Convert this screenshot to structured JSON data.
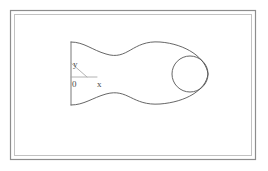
{
  "figure": {
    "title": "",
    "background_color": "#ffffff",
    "frame": {
      "outer_color": "#8d8d8d",
      "inner_color": "#c2c2c2",
      "outer": {
        "x": 10,
        "y": 10,
        "width": 246,
        "height": 150
      },
      "inner": {
        "x": 14,
        "y": 14,
        "width": 238,
        "height": 142
      }
    },
    "drawing": {
      "name": "fish-body-profile",
      "stroke_color": "#555555",
      "origin": {
        "x": 71,
        "y": 77
      },
      "tail_edge": {
        "x": 71,
        "y_top": 42,
        "y_bottom": 105
      },
      "body_path": "M71,42 C84,42 92,50 106,54 C128,61 132,40 160,42 C186,44 206,58 208,74 C206,90 186,102 160,104 C132,106 128,88 106,94 C92,98 84,105 71,105",
      "nose_circle": {
        "cx": 190,
        "cy": 74,
        "r": 18,
        "stroke_color": "#555555"
      },
      "angle_diagonal": {
        "x1": 71,
        "y1": 63,
        "x2": 87,
        "y2": 77,
        "stroke_color": "#a9a9a9"
      },
      "angle_horizontal": {
        "x1": 71,
        "y1": 77,
        "x2": 97,
        "y2": 77,
        "stroke_color": "#a9a9a9"
      }
    },
    "labels": {
      "y_axis": "y",
      "origin": "0",
      "x_axis": "x"
    },
    "label_positions": {
      "y_axis": {
        "x": 73,
        "y": 67
      },
      "origin": {
        "x": 72,
        "y": 87
      },
      "x_axis": {
        "x": 97,
        "y": 87
      }
    }
  }
}
